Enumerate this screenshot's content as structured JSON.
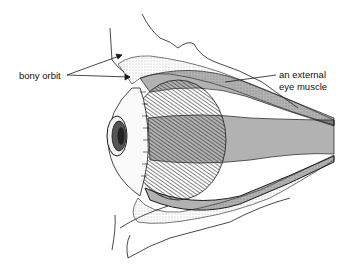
{
  "figure": {
    "labels": {
      "bony_orbit": "bony orbit",
      "external_muscle_line1": "an external",
      "external_muscle_line2": "eye muscle"
    },
    "colors": {
      "ink": "#1a1a1a",
      "background": "#ffffff",
      "stipple": "#6a6a6a"
    }
  }
}
